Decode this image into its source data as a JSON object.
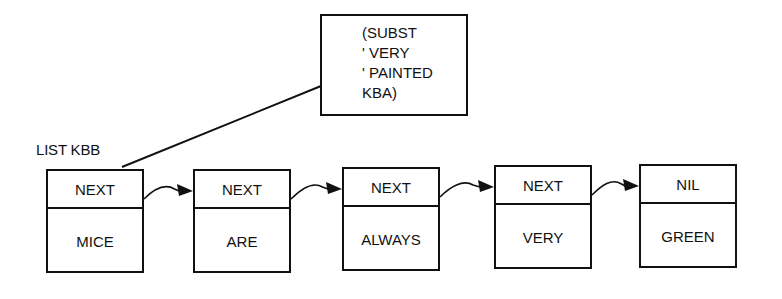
{
  "diagram": {
    "list_label": "LIST KBB",
    "annotation_box": {
      "lines": [
        "(SUBST",
        "' VERY",
        "' PAINTED",
        "KBA)"
      ]
    },
    "nodes": [
      {
        "pointer": "NEXT",
        "value": "MICE"
      },
      {
        "pointer": "NEXT",
        "value": "ARE"
      },
      {
        "pointer": "NEXT",
        "value": "ALWAYS"
      },
      {
        "pointer": "NEXT",
        "value": "VERY"
      },
      {
        "pointer": "NIL",
        "value": "GREEN"
      }
    ],
    "edges": [
      {
        "from": 0,
        "to": 1
      },
      {
        "from": 1,
        "to": 2
      },
      {
        "from": 2,
        "to": 3
      },
      {
        "from": 3,
        "to": 4
      }
    ]
  }
}
